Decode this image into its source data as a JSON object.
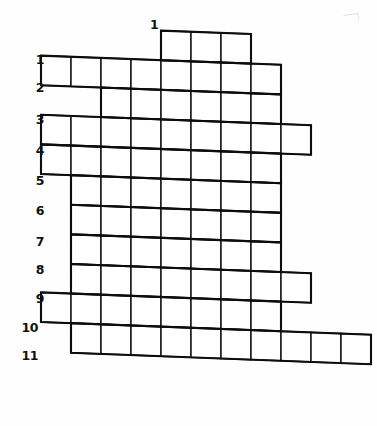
{
  "page": {
    "background_color": "#ffffff",
    "ink_color": "#121212",
    "width": 377,
    "height": 426
  },
  "column_labels": [
    {
      "text": "1",
      "x": 150,
      "y": 19
    }
  ],
  "row_labels": [
    {
      "text": "1",
      "x": 18,
      "y": 54
    },
    {
      "text": "2",
      "x": 18,
      "y": 82
    },
    {
      "text": "3",
      "x": 18,
      "y": 114
    },
    {
      "text": "4",
      "x": 18,
      "y": 145
    },
    {
      "text": "5",
      "x": 18,
      "y": 175
    },
    {
      "text": "6",
      "x": 18,
      "y": 205
    },
    {
      "text": "7",
      "x": 18,
      "y": 236
    },
    {
      "text": "8",
      "x": 18,
      "y": 264
    },
    {
      "text": "9",
      "x": 18,
      "y": 293
    },
    {
      "text": "10",
      "x": 12,
      "y": 322
    },
    {
      "text": "11",
      "x": 12,
      "y": 350
    }
  ],
  "grid": {
    "type": "crossword-skeleton",
    "row_count": 11,
    "column_count": 11,
    "cell_width": 30.0,
    "cell_height": 29.6,
    "origin_x": 41.0,
    "origin_y": 26.0,
    "skew_per_column": 1.15,
    "note": "Each row lists the inclusive 1-based column span of filled cells.",
    "rows": [
      {
        "row": 1,
        "start_col": 5,
        "end_col": 7,
        "cell_count": 3
      },
      {
        "row": 2,
        "start_col": 1,
        "end_col": 8,
        "cell_count": 8
      },
      {
        "row": 3,
        "start_col": 3,
        "end_col": 8,
        "cell_count": 6
      },
      {
        "row": 4,
        "start_col": 1,
        "end_col": 9,
        "cell_count": 9
      },
      {
        "row": 5,
        "start_col": 1,
        "end_col": 8,
        "cell_count": 8
      },
      {
        "row": 6,
        "start_col": 2,
        "end_col": 8,
        "cell_count": 7
      },
      {
        "row": 7,
        "start_col": 2,
        "end_col": 8,
        "cell_count": 7
      },
      {
        "row": 8,
        "start_col": 2,
        "end_col": 8,
        "cell_count": 7
      },
      {
        "row": 9,
        "start_col": 2,
        "end_col": 9,
        "cell_count": 8
      },
      {
        "row": 10,
        "start_col": 1,
        "end_col": 8,
        "cell_count": 8
      },
      {
        "row": 11,
        "start_col": 2,
        "end_col": 11,
        "cell_count": 10
      }
    ]
  }
}
